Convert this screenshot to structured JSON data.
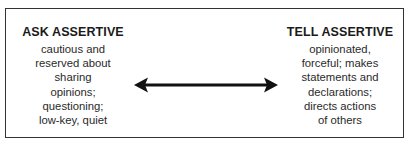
{
  "diagram": {
    "left": {
      "title": "ASK ASSERTIVE",
      "lines": [
        "cautious and",
        "reserved about",
        "sharing",
        "opinions;",
        "questioning;",
        "low-key, quiet"
      ]
    },
    "right": {
      "title": "TELL ASSERTIVE",
      "lines": [
        "opinionated,",
        "forceful; makes",
        "statements and",
        "declarations;",
        "directs actions",
        "of others"
      ]
    },
    "connector": {
      "type": "double-headed-arrow",
      "color": "#111111"
    }
  }
}
